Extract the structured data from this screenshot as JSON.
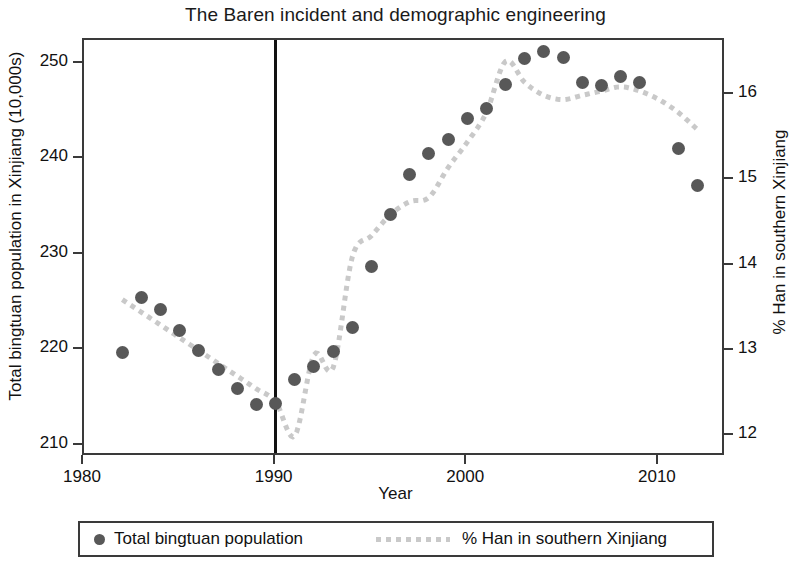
{
  "chart_data": {
    "type": "scatter",
    "title": "The Baren incident and demographic engineering",
    "xlabel": "Year",
    "ylabel": "Total bingtuan population in Xinjiang (10,000s)",
    "ylabel_secondary": "% Han in southern Xinjiang",
    "xlim": [
      1980.0,
      2013.5
    ],
    "ylim": [
      208.8,
      252.5
    ],
    "ylim_secondary": [
      11.75,
      16.65
    ],
    "xticks": [
      1980,
      1990,
      2000,
      2010
    ],
    "xtick_labels": [
      "1980",
      "1990",
      "2000",
      "2010"
    ],
    "yticks": [
      210,
      220,
      230,
      240,
      250
    ],
    "ytick_labels": [
      "210",
      "220",
      "230",
      "240",
      "250"
    ],
    "yticks_secondary": [
      12,
      13,
      14,
      15,
      16
    ],
    "ytick_labels_secondary": [
      "12",
      "13",
      "14",
      "15",
      "16"
    ],
    "grid": false,
    "legend_position": "below-plot",
    "annotations": [
      {
        "name": "baren-incident-marker",
        "type": "vertical-line",
        "x": 1990,
        "color": "#111111"
      }
    ],
    "series": [
      {
        "name": "Total bingtuan population",
        "type": "scatter",
        "axis": "left",
        "color": "#585858",
        "marker": "filled-circle",
        "x": [
          1982,
          1983,
          1984,
          1985,
          1986,
          1987,
          1988,
          1989,
          1990,
          1991,
          1992,
          1993,
          1994,
          1995,
          1996,
          1997,
          1998,
          1999,
          2000,
          2001,
          2002,
          2003,
          2004,
          2005,
          2006,
          2007,
          2008,
          2009,
          2011,
          2012
        ],
        "values": [
          219.7,
          225.5,
          224.3,
          222.1,
          220.0,
          218.0,
          216.0,
          214.3,
          214.4,
          216.9,
          218.3,
          219.9,
          222.4,
          228.8,
          234.2,
          238.4,
          240.6,
          242.1,
          244.3,
          245.3,
          247.8,
          250.6,
          251.3,
          250.7,
          248.0,
          247.7,
          248.7,
          248.0,
          241.1,
          237.3
        ]
      },
      {
        "name": "% Han in southern Xinjiang",
        "type": "line",
        "axis": "right",
        "color": "#c9c9c9",
        "linestyle": "dotted",
        "x": [
          1982,
          1983,
          1984,
          1985,
          1986,
          1987,
          1988,
          1989,
          1990,
          1991,
          1992,
          1993,
          1994,
          1995,
          1996,
          1997,
          1998,
          1999,
          2000,
          2001,
          2002,
          2003,
          2004,
          2005,
          2006,
          2007,
          2008,
          2009,
          2010,
          2011,
          2012
        ],
        "values": [
          13.6,
          13.45,
          13.3,
          13.15,
          13.0,
          12.85,
          12.7,
          12.55,
          12.4,
          12.0,
          12.95,
          12.8,
          14.1,
          14.35,
          14.6,
          14.75,
          14.8,
          15.15,
          15.45,
          15.8,
          16.4,
          16.15,
          16.0,
          15.95,
          16.0,
          16.05,
          16.1,
          16.05,
          15.95,
          15.8,
          15.6
        ]
      }
    ]
  },
  "legend": {
    "entries": [
      {
        "label": "Total bingtuan population",
        "marker": "filled-circle",
        "color": "#585858"
      },
      {
        "label": "% Han in southern Xinjiang",
        "marker": "dotted-line",
        "color": "#c9c9c9"
      }
    ]
  }
}
